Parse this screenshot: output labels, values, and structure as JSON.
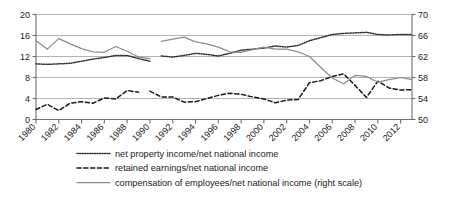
{
  "chart_data": {
    "type": "line",
    "title": "",
    "subtitle": "",
    "xlabel": "",
    "ylabel": "",
    "y2label": "",
    "grid": true,
    "legend_position": "bottom",
    "x": [
      1980,
      1981,
      1982,
      1983,
      1984,
      1985,
      1986,
      1987,
      1988,
      1989,
      1990,
      1991,
      1992,
      1993,
      1994,
      1995,
      1996,
      1997,
      1998,
      1999,
      2000,
      2001,
      2002,
      2003,
      2004,
      2005,
      2006,
      2007,
      2008,
      2009,
      2010,
      2011,
      2012,
      2013
    ],
    "xtick_labels": [
      "1980",
      "1982",
      "1984",
      "1986",
      "1988",
      "1990",
      "1992",
      "1994",
      "1996",
      "1998",
      "2000",
      "2002",
      "2004",
      "2006",
      "2008",
      "2010",
      "2012"
    ],
    "xtick_values": [
      1980,
      1982,
      1984,
      1986,
      1988,
      1990,
      1992,
      1994,
      1996,
      1998,
      2000,
      2002,
      2004,
      2006,
      2008,
      2010,
      2012
    ],
    "xlim": [
      1980,
      2013
    ],
    "ylim": [
      0,
      20
    ],
    "ytick_labels": [
      "0",
      "4",
      "8",
      "12",
      "16",
      "20"
    ],
    "ytick_values": [
      0,
      4,
      8,
      12,
      16,
      20
    ],
    "y2lim": [
      50,
      70
    ],
    "y2tick_labels": [
      "50",
      "54",
      "58",
      "62",
      "66",
      "70"
    ],
    "y2tick_values": [
      50,
      54,
      58,
      62,
      66,
      70
    ],
    "series": [
      {
        "name": "net property income/net national income",
        "legend_key": "net-property-income",
        "style": "dotted",
        "color": "#333333",
        "axis": "left",
        "x": [
          1980,
          1981,
          1982,
          1983,
          1984,
          1985,
          1986,
          1987,
          1988,
          1989,
          1990
        ],
        "values": [
          10.6,
          10.5,
          10.6,
          10.7,
          11.1,
          11.5,
          11.8,
          12.2,
          12.2,
          11.6,
          11.1
        ]
      },
      {
        "name": "net property income/net national income (continued)",
        "legend_key": "net-property-income-2",
        "style": "dotted",
        "color": "#333333",
        "axis": "left",
        "x": [
          1991,
          1992,
          1993,
          1994,
          1995,
          1996,
          1997,
          1998,
          1999,
          2000,
          2001,
          2002,
          2003,
          2004,
          2005,
          2006,
          2007,
          2008,
          2009,
          2010,
          2011,
          2012,
          2013
        ],
        "values": [
          12.1,
          11.9,
          12.2,
          12.6,
          12.4,
          12.1,
          12.6,
          13.2,
          13.4,
          13.6,
          14.0,
          13.8,
          14.1,
          15.0,
          15.6,
          16.2,
          16.4,
          16.5,
          16.6,
          16.2,
          16.1,
          16.2,
          16.2
        ]
      },
      {
        "name": "retained earnings/net national income",
        "legend_key": "retained-earnings",
        "style": "dashed",
        "color": "#1a1a1a",
        "axis": "left",
        "x": [
          1980,
          1981,
          1982,
          1983,
          1984,
          1985,
          1986,
          1987,
          1988,
          1989
        ],
        "values": [
          1.9,
          2.9,
          1.7,
          3.1,
          3.4,
          3.1,
          4.1,
          3.9,
          5.5,
          5.2
        ]
      },
      {
        "name": "retained earnings/net national income (continued)",
        "legend_key": "retained-earnings-2",
        "style": "dashed",
        "color": "#1a1a1a",
        "axis": "left",
        "x": [
          1990,
          1991,
          1992,
          1993,
          1994,
          1995,
          1996,
          1997,
          1998,
          1999,
          2000,
          2001,
          2002,
          2003,
          2004,
          2005,
          2006,
          2007,
          2008,
          2009,
          2010,
          2011,
          2012,
          2013
        ],
        "values": [
          5.4,
          4.3,
          4.3,
          3.3,
          3.4,
          4.0,
          4.6,
          5.0,
          4.8,
          4.3,
          3.9,
          3.2,
          3.7,
          3.8,
          7.0,
          7.4,
          8.2,
          8.7,
          6.5,
          4.2,
          7.3,
          6.0,
          5.6,
          5.7
        ]
      },
      {
        "name": "compensation of employees/net national income (right scale)",
        "legend_key": "compensation-of-employees",
        "style": "solid",
        "color": "#8c8c8c",
        "axis": "right",
        "x": [
          1980,
          1981,
          1982,
          1983,
          1984,
          1985,
          1986,
          1987,
          1988,
          1989,
          1990
        ],
        "values": [
          65.0,
          63.4,
          65.4,
          64.4,
          63.5,
          62.9,
          62.8,
          63.9,
          63.0,
          61.9,
          61.6
        ]
      },
      {
        "name": "compensation of employees/net national income (right scale, continued)",
        "legend_key": "compensation-of-employees-2",
        "style": "solid",
        "color": "#8c8c8c",
        "axis": "right",
        "x": [
          1991,
          1992,
          1993,
          1994,
          1995,
          1996,
          1997,
          1998,
          1999,
          2000,
          2001,
          2002,
          2003,
          2004,
          2005,
          2006,
          2007,
          2008,
          2009,
          2010,
          2011,
          2012,
          2013
        ],
        "values": [
          64.9,
          65.3,
          65.7,
          64.8,
          64.4,
          63.8,
          62.9,
          62.8,
          63.3,
          63.8,
          63.4,
          63.4,
          62.9,
          62.0,
          59.9,
          57.9,
          56.8,
          58.4,
          58.2,
          57.1,
          57.6,
          58.0,
          57.6
        ]
      }
    ],
    "legend": [
      {
        "label": "net property income/net national income",
        "style": "dotted",
        "color": "#333333"
      },
      {
        "label": "retained earnings/net national income",
        "style": "dashed",
        "color": "#1a1a1a"
      },
      {
        "label": "compensation of employees/net national income (right scale)",
        "style": "solid",
        "color": "#8c8c8c"
      }
    ],
    "colors": {
      "grid": "#aaaaaa",
      "axis": "#6f6f6f",
      "text": "#1a1a1a",
      "background": "#ffffff"
    }
  }
}
